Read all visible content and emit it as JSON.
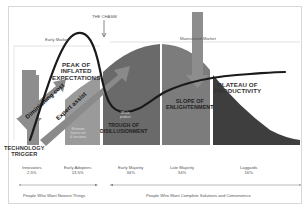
{
  "diagram": {
    "title_top": "THE CHASM",
    "markets": {
      "early": "Early Market",
      "mainstream": "Mainstream Market"
    },
    "hype_cycle_phases": [
      {
        "id": "trigger",
        "label_line1": "TECHNOLOGY",
        "label_line2": "TRIGGER"
      },
      {
        "id": "peak",
        "label_line1": "PEAK OF",
        "label_line2": "INFLATED",
        "label_line3": "EXPECTATIONS"
      },
      {
        "id": "trough",
        "label_line1": "TROUGH OF",
        "label_line2": "DISILLUSIONMENT"
      },
      {
        "id": "slope",
        "label_line1": "SLOPE OF",
        "label_line2": "ENLIGHTENMENT"
      },
      {
        "id": "plateau",
        "label_line1": "PLATEAU OF",
        "label_line2": "PRODUCTIVITY"
      }
    ],
    "arrow_labels": {
      "dev_cost": "Diminishing cost",
      "expert": "Expert assist"
    },
    "adopter_segments": [
      {
        "name": "Innovators",
        "pct": "2.5%"
      },
      {
        "name": "Early Adopters",
        "pct": "13.5%"
      },
      {
        "name": "Early Majority",
        "pct": "34%"
      },
      {
        "name": "Late Majority",
        "pct": "34%"
      },
      {
        "name": "Laggards",
        "pct": "16%"
      }
    ],
    "bar_notes": {
      "early_adopters": [
        "Minimum",
        "feature set",
        "& Iterations"
      ],
      "early_majority": [
        "Whole",
        "product"
      ]
    },
    "footer_groups": {
      "left": "People Who Want Newest Things",
      "right": "People Who Want Complete Solutions and Convenience"
    },
    "colors": {
      "bar_light": "#9a9a9a",
      "bar_mid": "#7c7c7c",
      "bar_dark": "#5f5f5f",
      "bar_darkest": "#3e3e3e",
      "curve": "#1a1a1a",
      "arrow": "#8a8a8a"
    }
  }
}
